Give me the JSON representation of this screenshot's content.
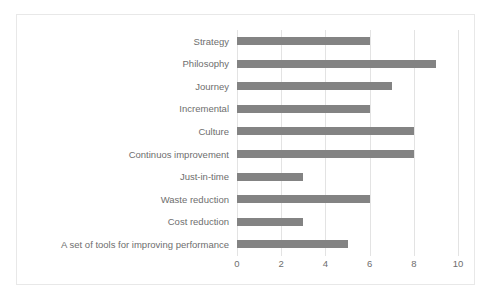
{
  "chart_data": {
    "type": "bar",
    "orientation": "horizontal",
    "title": "",
    "subtitle": "",
    "xlabel": "",
    "ylabel": "",
    "xlim": [
      0,
      10
    ],
    "xticks": [
      0,
      2,
      4,
      6,
      8,
      10
    ],
    "xtick_labels": [
      "0",
      "2",
      "4",
      "6",
      "8",
      "10"
    ],
    "grid": true,
    "grid_axis": "x",
    "legend": false,
    "legend_position": "none",
    "bar_color": "#838383",
    "text_color": "#6e6e6e",
    "gridline_color": "#e3e3e3",
    "border_color": "#e8e8e8",
    "background_color": "#ffffff",
    "categories": [
      "Strategy",
      "Philosophy",
      "Journey",
      "Incremental",
      "Culture",
      "Continuos improvement",
      "Just-in-time",
      "Waste reduction",
      "Cost reduction",
      "A set of tools for improving performance"
    ],
    "values": [
      6,
      9,
      7,
      6,
      8,
      8,
      3,
      6,
      3,
      5
    ]
  }
}
